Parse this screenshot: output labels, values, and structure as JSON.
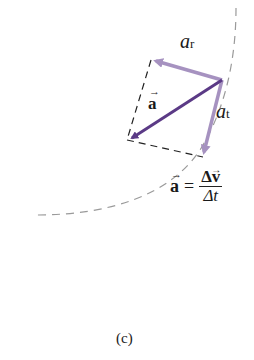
{
  "diagram": {
    "labels": {
      "a_r": "a",
      "a_r_sub": "r",
      "a_t": "a",
      "a_t_sub": "t",
      "a_vec": "a",
      "eq_lhs": "a",
      "eq_equals": "=",
      "eq_num": "Δv",
      "eq_den": "Δt",
      "caption": "(c)"
    },
    "colors": {
      "a_vector": "#5b3a86",
      "components": "#a692c0",
      "path": "#9a9a9a",
      "dashed_box": "#222222"
    }
  }
}
